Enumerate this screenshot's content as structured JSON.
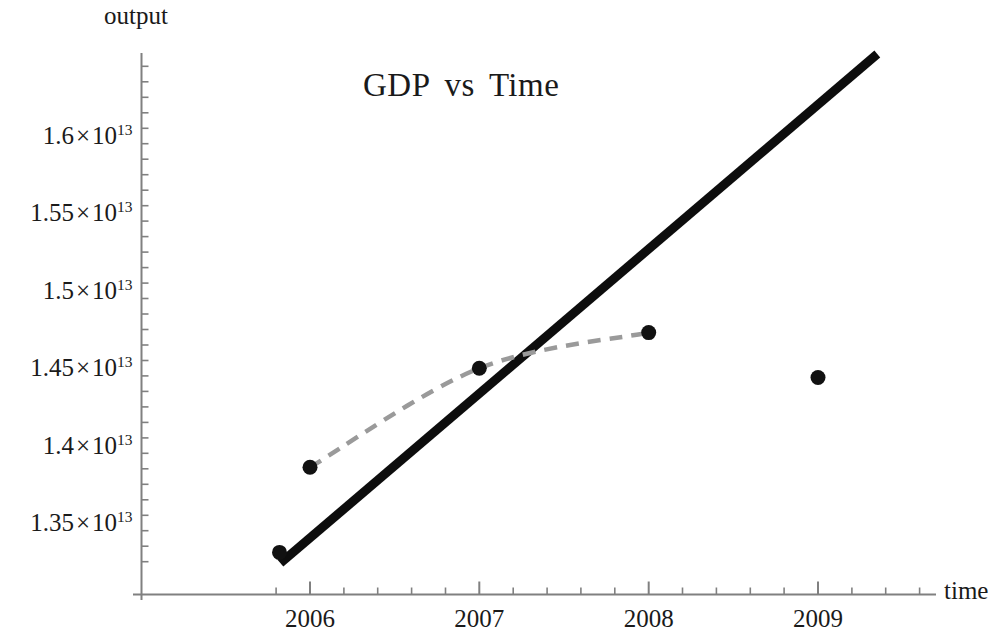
{
  "chart_data": {
    "type": "scatter",
    "title_parts": [
      "GDP",
      "vs",
      "Time"
    ],
    "xlabel": "time",
    "ylabel": "output",
    "x": [
      2005.82,
      2006,
      2007,
      2008,
      2009
    ],
    "values": [
      13310000000000,
      13860000000000,
      14500000000000,
      14730000000000,
      14440000000000
    ],
    "point_labels": [
      "1.331×10^13",
      "1.386×10^13",
      "1.450×10^13",
      "1.473×10^13",
      "1.444×10^13"
    ],
    "xlim": [
      2005.82,
      2009.5
    ],
    "ylim": [
      13237000000000,
      16534000000000
    ],
    "grid": false,
    "legend": false,
    "series": [
      {
        "name": "GDP data points",
        "style": "points",
        "color": "#111111",
        "x": [
          2005.82,
          2006,
          2007,
          2008,
          2009
        ],
        "values": [
          13310000000000,
          13860000000000,
          14500000000000,
          14730000000000,
          14440000000000
        ]
      },
      {
        "name": "Interpolating curve",
        "style": "dashed-line",
        "color": "#9a9a9a",
        "x": [
          2006,
          2007,
          2008
        ],
        "values": [
          13860000000000,
          14500000000000,
          14730000000000
        ]
      },
      {
        "name": "Linear trend",
        "style": "thick-line",
        "color": "#0d0d0d",
        "x": [
          2005.825,
          2009.35
        ],
        "values": [
          13240000000000,
          16530000000000
        ]
      }
    ],
    "y_ticks": [
      {
        "value": 16000000000000,
        "mantissa": "1.6",
        "times": "×",
        "base": "10",
        "exponent": "13"
      },
      {
        "value": 15500000000000,
        "mantissa": "1.55",
        "times": "×",
        "base": "10",
        "exponent": "13"
      },
      {
        "value": 15000000000000,
        "mantissa": "1.5",
        "times": "×",
        "base": "10",
        "exponent": "13"
      },
      {
        "value": 14500000000000,
        "mantissa": "1.45",
        "times": "×",
        "base": "10",
        "exponent": "13"
      },
      {
        "value": 14000000000000,
        "mantissa": "1.4",
        "times": "×",
        "base": "10",
        "exponent": "13"
      },
      {
        "value": 13500000000000,
        "mantissa": "1.35",
        "times": "×",
        "base": "10",
        "exponent": "13"
      }
    ],
    "x_ticks": [
      {
        "value": 2006,
        "label": "2006"
      },
      {
        "value": 2007,
        "label": "2007"
      },
      {
        "value": 2008,
        "label": "2008"
      },
      {
        "value": 2009,
        "label": "2009"
      }
    ],
    "axis_color": "#808080",
    "text_color": "#1a1a1a"
  }
}
